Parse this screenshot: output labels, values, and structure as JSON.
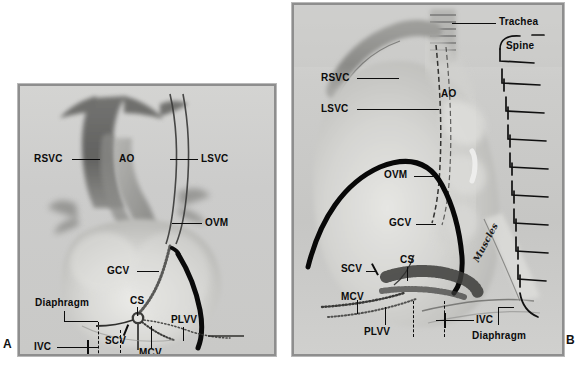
{
  "figure": {
    "background_color": "#ffffff",
    "panel_fill_color": "#cfcfcf",
    "panel_border_color": "#8e8e8e",
    "label_color": "#0b0b0b"
  },
  "panels": [
    {
      "id": "A",
      "letter": "A",
      "view": "anterior view of heart specimen",
      "labels": [
        {
          "key": "rsvc",
          "text": "RSVC",
          "leader": "horizontal-right"
        },
        {
          "key": "ao",
          "text": "AO",
          "leader": "none"
        },
        {
          "key": "lsvc",
          "text": "LSVC",
          "leader": "horizontal-left"
        },
        {
          "key": "ovm",
          "text": "OVM",
          "leader": "horizontal-left"
        },
        {
          "key": "gcv",
          "text": "GCV",
          "leader": "horizontal-right-arrow"
        },
        {
          "key": "cs",
          "text": "CS",
          "leader": "vertical-down"
        },
        {
          "key": "scv",
          "text": "SCV",
          "leader": "diagonal-up-right"
        },
        {
          "key": "mcv",
          "text": "MCV",
          "leader": "vertical-up"
        },
        {
          "key": "plvv",
          "text": "PLVV",
          "leader": "vertical-down"
        },
        {
          "key": "diaphragm",
          "text": "Diaphragm",
          "leader": "vertical-down-then-right"
        },
        {
          "key": "ivc",
          "text": "IVC",
          "leader": "horizontal-right-cross"
        }
      ]
    },
    {
      "id": "B",
      "letter": "B",
      "view": "lateral view of heart specimen with spine and trachea",
      "labels": [
        {
          "key": "trachea",
          "text": "Trachea",
          "leader": "horizontal-left"
        },
        {
          "key": "spine",
          "text": "Spine",
          "leader": "bracket"
        },
        {
          "key": "rsvc",
          "text": "RSVC",
          "leader": "horizontal-right"
        },
        {
          "key": "lsvc",
          "text": "LSVC",
          "leader": "horizontal-right"
        },
        {
          "key": "ao",
          "text": "AO",
          "leader": "none"
        },
        {
          "key": "ovm",
          "text": "OVM",
          "leader": "horizontal-right"
        },
        {
          "key": "gcv",
          "text": "GCV",
          "leader": "horizontal-right"
        },
        {
          "key": "cs",
          "text": "CS",
          "leader": "vertical-down"
        },
        {
          "key": "scv",
          "text": "SCV",
          "leader": "diagonal-up-right"
        },
        {
          "key": "mcv",
          "text": "MCV",
          "leader": "vertical-down"
        },
        {
          "key": "plvv",
          "text": "PLVV",
          "leader": "vertical-up"
        },
        {
          "key": "ivc",
          "text": "IVC",
          "leader": "horizontal-left-cross"
        },
        {
          "key": "diaphragm",
          "text": "Diaphragm",
          "leader": "vertical-up"
        },
        {
          "key": "muscles",
          "text": "Muscles",
          "leader": "rotated-script"
        }
      ]
    }
  ],
  "abbreviations": {
    "RSVC": "right superior vena cava",
    "LSVC": "left superior vena cava",
    "AO": "aorta",
    "OVM": "oblique vein of Marshall",
    "GCV": "great cardiac vein",
    "CS": "coronary sinus",
    "SCV": "small cardiac vein",
    "MCV": "middle cardiac vein",
    "PLVV": "posterolateral ventricular vein",
    "IVC": "inferior vena cava"
  }
}
